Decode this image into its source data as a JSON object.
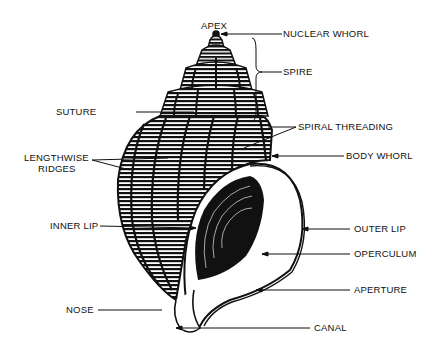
{
  "diagram": {
    "labels": {
      "apex": "APEX",
      "nuclear_whorl": "NUCLEAR WHORL",
      "spire": "SPIRE",
      "suture": "SUTURE",
      "spiral_threading": "SPIRAL THREADING",
      "body_whorl": "BODY WHORL",
      "lengthwise_ridges_1": "LENGTHWISE",
      "lengthwise_ridges_2": "RIDGES",
      "inner_lip": "INNER LIP",
      "outer_lip": "OUTER LIP",
      "operculum": "OPERCULUM",
      "aperture": "APERTURE",
      "nose": "NOSE",
      "canal": "CANAL"
    },
    "colors": {
      "ink": "#111111",
      "background": "#ffffff"
    }
  }
}
